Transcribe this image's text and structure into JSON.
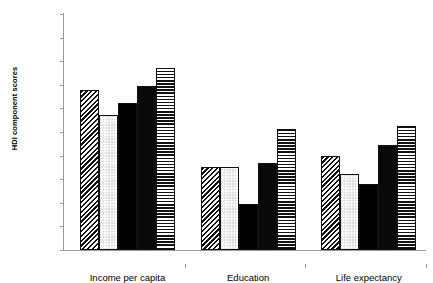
{
  "chart_data": {
    "type": "bar",
    "title": "",
    "subtitle": "",
    "xlabel": "",
    "ylabel": "HDI component scores",
    "ylim": [
      0.5,
      1
    ],
    "ytick_labels": [
      "1",
      "0.95",
      "0.9",
      "0.85",
      "0.8",
      "0.75",
      "0.7",
      "0.65",
      "0.6",
      "0.55",
      "0.5"
    ],
    "ytick_values": [
      1,
      0.95,
      0.9,
      0.85,
      0.8,
      0.75,
      0.7,
      0.65,
      0.6,
      0.55,
      0.5
    ],
    "grid": false,
    "legend_position": "none",
    "categories": [
      "Income per capita",
      "Education",
      "Life expectancy"
    ],
    "series": [
      {
        "name": "series-1",
        "pattern": "diagonal-hatch",
        "values": [
          0.84,
          0.675,
          0.7
        ]
      },
      {
        "name": "series-2",
        "pattern": "checkerboard",
        "values": [
          0.786,
          0.675,
          0.66
        ]
      },
      {
        "name": "series-3",
        "pattern": "solid-black",
        "values": [
          0.812,
          0.598,
          0.64
        ]
      },
      {
        "name": "series-4",
        "pattern": "dotted-black",
        "values": [
          0.848,
          0.685,
          0.722
        ]
      },
      {
        "name": "series-5",
        "pattern": "horizontal-lines",
        "values": [
          0.886,
          0.757,
          0.762
        ]
      }
    ],
    "annotations": []
  },
  "axis": {
    "line_color": "#9a9a9a",
    "bar_outline_color": "#111111",
    "bar_solid_color": "#000000"
  },
  "crop_remnant": {
    "left_fragment": "",
    "mid_fragment": "",
    "right_fragment": ""
  }
}
